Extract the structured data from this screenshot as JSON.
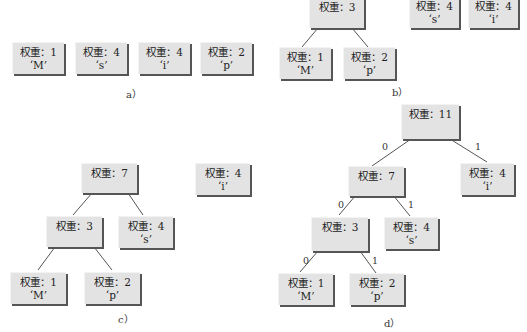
{
  "weight_prefix": "权重：",
  "panels": {
    "a": {
      "caption": "a）",
      "nodes": [
        {
          "weight": "权重：1",
          "char": "‘M’"
        },
        {
          "weight": "权重：4",
          "char": "‘s’"
        },
        {
          "weight": "权重：4",
          "char": "‘i’"
        },
        {
          "weight": "权重：2",
          "char": "‘p’"
        }
      ]
    },
    "b": {
      "caption": "b）",
      "root": {
        "weight": "权重：3"
      },
      "left": {
        "weight": "权重：1",
        "char": "‘M’"
      },
      "right": {
        "weight": "权重：2",
        "char": "‘p’"
      },
      "others": [
        {
          "weight": "权重：4",
          "char": "‘s’"
        },
        {
          "weight": "权重：4",
          "char": "‘i’"
        }
      ]
    },
    "c": {
      "caption": "c）",
      "root": {
        "weight": "权重：7"
      },
      "n3": {
        "weight": "权重：3"
      },
      "s": {
        "weight": "权重：4",
        "char": "‘s’"
      },
      "m": {
        "weight": "权重：1",
        "char": "‘M’"
      },
      "p": {
        "weight": "权重：2",
        "char": "‘p’"
      },
      "i": {
        "weight": "权重：4",
        "char": "‘i’"
      }
    },
    "d": {
      "caption": "d）",
      "root": {
        "weight": "权重：11"
      },
      "n7": {
        "weight": "权重：7"
      },
      "i": {
        "weight": "权重：4",
        "char": "‘i’"
      },
      "n3": {
        "weight": "权重：3"
      },
      "s": {
        "weight": "权重：4",
        "char": "‘s’"
      },
      "m": {
        "weight": "权重：1",
        "char": "‘M’"
      },
      "p": {
        "weight": "权重：2",
        "char": "‘p’"
      },
      "edge_labels": {
        "zero": "0",
        "one": "1"
      }
    }
  },
  "colors": {
    "node_fill": "#e3e3e3",
    "node_shadow": "#555555",
    "edge": "#444444"
  }
}
